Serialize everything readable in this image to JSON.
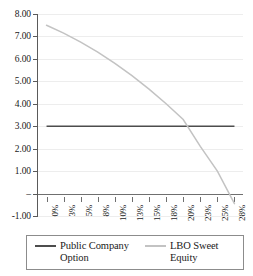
{
  "chart_data": {
    "type": "line",
    "title": "",
    "xlabel": "",
    "ylabel": "",
    "xlim": [
      0,
      28
    ],
    "ylim": [
      -1.0,
      8.0
    ],
    "grid": true,
    "legend_position": "bottom",
    "categories": [
      "0%",
      "3%",
      "5%",
      "8%",
      "10%",
      "13%",
      "15%",
      "18%",
      "20%",
      "23%",
      "25%",
      "28%"
    ],
    "x_tick_labels": [
      "0%",
      "3%",
      "5%",
      "8%",
      "10%",
      "13%",
      "15%",
      "18%",
      "20%",
      "23%",
      "25%",
      "28%"
    ],
    "y_tick_labels": [
      "8.00",
      "7.00",
      "6.00",
      "5.00",
      "4.00",
      "3.00",
      "2.00",
      "1.00",
      "–",
      "-1.00"
    ],
    "y_tick_values": [
      8.0,
      7.0,
      6.0,
      5.0,
      4.0,
      3.0,
      2.0,
      1.0,
      0.0,
      -1.0
    ],
    "series": [
      {
        "name": "Public Company Option",
        "color": "#4d4d4d",
        "type": "line",
        "values": [
          3.0,
          3.0,
          3.0,
          3.0,
          3.0,
          3.0,
          3.0,
          3.0,
          3.0,
          3.0,
          3.0,
          3.0
        ]
      },
      {
        "name": "LBO Sweet Equity",
        "color": "#c3c3c3",
        "type": "line",
        "values": [
          7.5,
          7.15,
          6.75,
          6.3,
          5.8,
          5.25,
          4.65,
          4.0,
          3.3,
          2.1,
          1.0,
          -0.45
        ]
      }
    ]
  },
  "legend": {
    "entries": [
      {
        "label": "Public Company Option",
        "color": "#4d4d4d"
      },
      {
        "label": "LBO Sweet Equity",
        "color": "#c3c3c3"
      }
    ]
  }
}
